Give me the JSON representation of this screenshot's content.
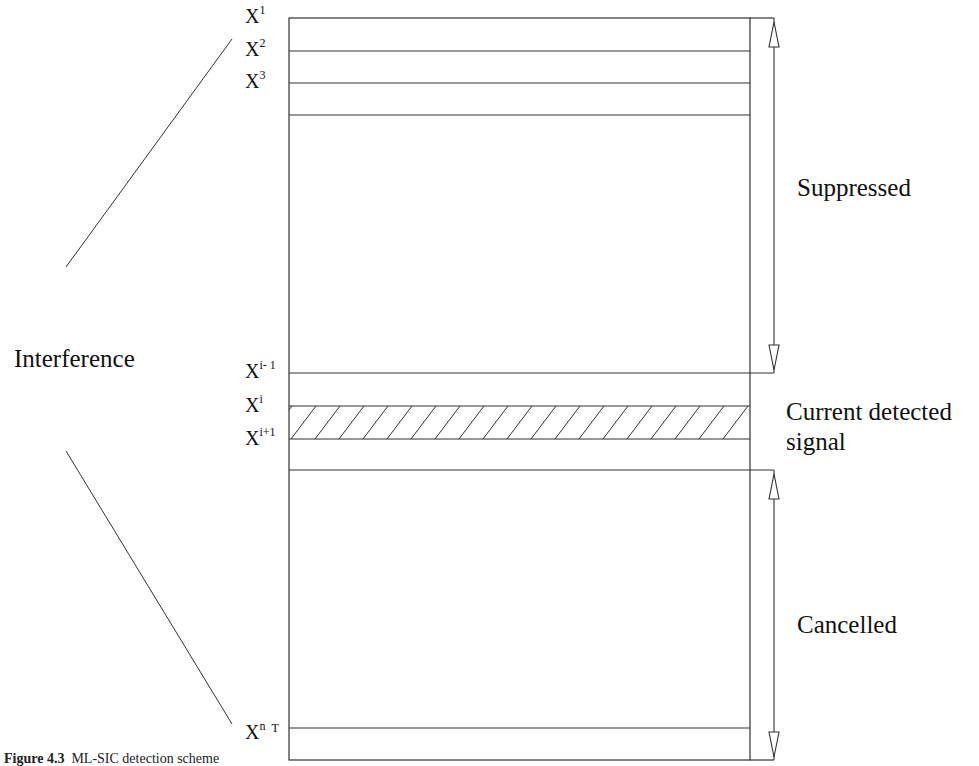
{
  "diagram": {
    "left_label": "Interference",
    "rows": [
      {
        "base": "X",
        "sup": "1"
      },
      {
        "base": "X",
        "sup": "2"
      },
      {
        "base": "X",
        "sup": "3"
      },
      {
        "base": "X",
        "sup": "i- 1"
      },
      {
        "base": "X",
        "sup": "i"
      },
      {
        "base": "X",
        "sup": "i+1"
      },
      {
        "base": "X",
        "sup": "n",
        "suffix": "T"
      }
    ],
    "regions": {
      "suppressed": "Suppressed",
      "current_line1": "Current detected",
      "current_line2": "signal",
      "cancelled": "Cancelled"
    },
    "caption": {
      "figure": "Figure 4.3",
      "text": "ML-SIC detection scheme"
    }
  }
}
